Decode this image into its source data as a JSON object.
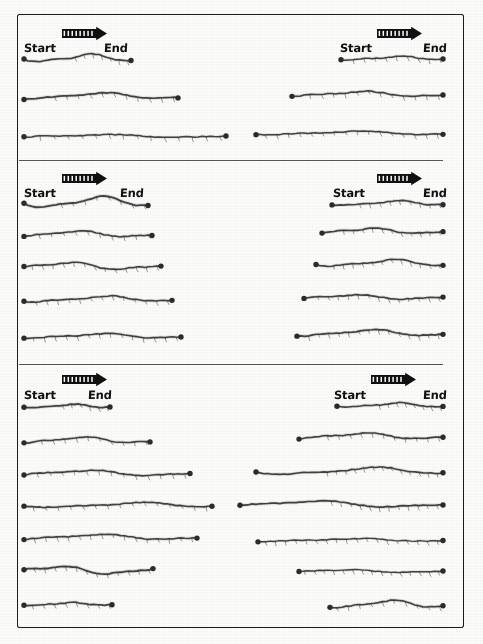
{
  "figure": {
    "kind": "hand-drawn-trajectory-sheet",
    "width": 483,
    "height": 644,
    "background_color": "#fdfdfc",
    "ink_color": "#2b2b2b",
    "frame": {
      "x": 17,
      "y": 14,
      "width": 447,
      "height": 614
    },
    "dividers": [
      {
        "y": 160,
        "x": 19,
        "width": 424
      },
      {
        "y": 364,
        "x": 19,
        "width": 424
      }
    ]
  },
  "labels": {
    "start": "Start",
    "end": "End",
    "arrow_icon": "striped-direction-arrow"
  },
  "chart_data": {
    "type": "line",
    "title": "",
    "xlabel": "",
    "ylabel": "",
    "panels": [
      {
        "id": "panel-1",
        "group": 1,
        "column": "left",
        "arrow": {
          "x": 62,
          "y": 28,
          "w": 45,
          "h": 11
        },
        "label_start": {
          "text": "Start",
          "x": 24,
          "y": 41
        },
        "label_end": {
          "text": "End",
          "x": 104,
          "y": 41
        },
        "traces": [
          {
            "id": "t1",
            "x0": 24,
            "x1": 131,
            "y": 58,
            "amp": 3.2,
            "phase": 0.3,
            "ticks": 7,
            "tick_start": 0.48,
            "weight": 1.6
          },
          {
            "id": "t2",
            "x0": 24,
            "x1": 178,
            "y": 96,
            "amp": 2.6,
            "phase": 1.1,
            "ticks": 11,
            "tick_start": 0.2,
            "weight": 1.7
          },
          {
            "id": "t3",
            "x0": 24,
            "x1": 226,
            "y": 136,
            "amp": 1.2,
            "phase": 2.0,
            "ticks": 14,
            "tick_start": 0.08,
            "weight": 1.5
          }
        ]
      },
      {
        "id": "panel-2",
        "group": 1,
        "column": "right",
        "arrow": {
          "x": 377,
          "y": 28,
          "w": 45,
          "h": 11
        },
        "label_start": {
          "text": "Start",
          "x": 340,
          "y": 41
        },
        "label_end": {
          "text": "End",
          "x": 423,
          "y": 41
        },
        "traces": [
          {
            "id": "t1",
            "x0": 341,
            "x1": 443,
            "y": 58,
            "amp": 1.6,
            "phase": 0.6,
            "ticks": 9,
            "tick_start": 0.12,
            "weight": 1.5
          },
          {
            "id": "t2",
            "x0": 292,
            "x1": 443,
            "y": 94,
            "amp": 2.2,
            "phase": 1.5,
            "ticks": 12,
            "tick_start": 0.12,
            "weight": 1.6
          },
          {
            "id": "t3",
            "x0": 256,
            "x1": 443,
            "y": 133,
            "amp": 1.5,
            "phase": 0.9,
            "ticks": 16,
            "tick_start": 0.05,
            "weight": 1.5
          }
        ]
      },
      {
        "id": "panel-3",
        "group": 2,
        "column": "left",
        "arrow": {
          "x": 62,
          "y": 173,
          "w": 45,
          "h": 11
        },
        "label_start": {
          "text": "Start",
          "x": 24,
          "y": 186
        },
        "label_end": {
          "text": "End",
          "x": 120,
          "y": 186
        },
        "traces": [
          {
            "id": "t1",
            "x0": 24,
            "x1": 148,
            "y": 202,
            "amp": 4.5,
            "phase": 0.2,
            "ticks": 8,
            "tick_start": 0.3,
            "weight": 1.8
          },
          {
            "id": "t2",
            "x0": 24,
            "x1": 152,
            "y": 234,
            "amp": 2.6,
            "phase": 1.8,
            "ticks": 10,
            "tick_start": 0.12,
            "weight": 1.6
          },
          {
            "id": "t3",
            "x0": 24,
            "x1": 161,
            "y": 266,
            "amp": 3.0,
            "phase": 2.6,
            "ticks": 13,
            "tick_start": 0.06,
            "weight": 1.6
          },
          {
            "id": "t4",
            "x0": 24,
            "x1": 172,
            "y": 299,
            "amp": 2.4,
            "phase": 0.8,
            "ticks": 13,
            "tick_start": 0.08,
            "weight": 1.6
          },
          {
            "id": "t5",
            "x0": 24,
            "x1": 181,
            "y": 336,
            "amp": 2.0,
            "phase": 1.2,
            "ticks": 14,
            "tick_start": 0.06,
            "weight": 1.6
          }
        ]
      },
      {
        "id": "panel-4",
        "group": 2,
        "column": "right",
        "arrow": {
          "x": 377,
          "y": 173,
          "w": 45,
          "h": 11
        },
        "label_start": {
          "text": "Start",
          "x": 333,
          "y": 186
        },
        "label_end": {
          "text": "End",
          "x": 423,
          "y": 186
        },
        "traces": [
          {
            "id": "t1",
            "x0": 332,
            "x1": 443,
            "y": 203,
            "amp": 2.0,
            "phase": 0.5,
            "ticks": 9,
            "tick_start": 0.25,
            "weight": 1.6
          },
          {
            "id": "t2",
            "x0": 322,
            "x1": 443,
            "y": 231,
            "amp": 2.4,
            "phase": 1.9,
            "ticks": 11,
            "tick_start": 0.18,
            "weight": 1.7
          },
          {
            "id": "t3",
            "x0": 316,
            "x1": 443,
            "y": 263,
            "amp": 2.8,
            "phase": 0.4,
            "ticks": 12,
            "tick_start": 0.14,
            "weight": 1.6
          },
          {
            "id": "t4",
            "x0": 304,
            "x1": 443,
            "y": 297,
            "amp": 2.0,
            "phase": 2.3,
            "ticks": 13,
            "tick_start": 0.1,
            "weight": 1.6
          },
          {
            "id": "t5",
            "x0": 297,
            "x1": 443,
            "y": 333,
            "amp": 2.6,
            "phase": 1.1,
            "ticks": 14,
            "tick_start": 0.08,
            "weight": 1.7
          }
        ]
      },
      {
        "id": "panel-5",
        "group": 3,
        "column": "left",
        "arrow": {
          "x": 62,
          "y": 374,
          "w": 45,
          "h": 11
        },
        "label_start": {
          "text": "Start",
          "x": 24,
          "y": 388
        },
        "label_end": {
          "text": "End",
          "x": 88,
          "y": 388
        },
        "traces": [
          {
            "id": "t1",
            "x0": 24,
            "x1": 110,
            "y": 406,
            "amp": 1.5,
            "phase": 0.7,
            "ticks": 6,
            "tick_start": 0.45,
            "weight": 1.8
          },
          {
            "id": "t2",
            "x0": 24,
            "x1": 150,
            "y": 440,
            "amp": 2.6,
            "phase": 1.4,
            "ticks": 10,
            "tick_start": 0.14,
            "weight": 1.6
          },
          {
            "id": "t3",
            "x0": 24,
            "x1": 190,
            "y": 473,
            "amp": 2.4,
            "phase": 2.1,
            "ticks": 13,
            "tick_start": 0.08,
            "weight": 1.6
          },
          {
            "id": "t4",
            "x0": 24,
            "x1": 212,
            "y": 505,
            "amp": 2.0,
            "phase": 0.3,
            "ticks": 15,
            "tick_start": 0.05,
            "weight": 1.6
          },
          {
            "id": "t5",
            "x0": 24,
            "x1": 197,
            "y": 537,
            "amp": 2.2,
            "phase": 1.7,
            "ticks": 15,
            "tick_start": 0.06,
            "weight": 1.6
          },
          {
            "id": "t6",
            "x0": 24,
            "x1": 153,
            "y": 570,
            "amp": 3.5,
            "phase": 2.9,
            "ticks": 12,
            "tick_start": 0.08,
            "weight": 1.8
          },
          {
            "id": "t7",
            "x0": 24,
            "x1": 112,
            "y": 604,
            "amp": 1.2,
            "phase": 0.9,
            "ticks": 8,
            "tick_start": 0.1,
            "weight": 1.6
          }
        ]
      },
      {
        "id": "panel-6",
        "group": 3,
        "column": "right",
        "arrow": {
          "x": 371,
          "y": 374,
          "w": 45,
          "h": 11
        },
        "label_start": {
          "text": "Start",
          "x": 334,
          "y": 388
        },
        "label_end": {
          "text": "End",
          "x": 423,
          "y": 388
        },
        "traces": [
          {
            "id": "t1",
            "x0": 337,
            "x1": 443,
            "y": 405,
            "amp": 1.8,
            "phase": 0.6,
            "ticks": 8,
            "tick_start": 0.4,
            "weight": 1.6
          },
          {
            "id": "t2",
            "x0": 299,
            "x1": 443,
            "y": 436,
            "amp": 2.6,
            "phase": 1.6,
            "ticks": 11,
            "tick_start": 0.2,
            "weight": 1.6
          },
          {
            "id": "t3",
            "x0": 256,
            "x1": 443,
            "y": 471,
            "amp": 3.0,
            "phase": 0.2,
            "ticks": 13,
            "tick_start": 0.38,
            "weight": 1.6
          },
          {
            "id": "t4",
            "x0": 240,
            "x1": 443,
            "y": 504,
            "amp": 2.6,
            "phase": 2.2,
            "ticks": 12,
            "tick_start": 0.45,
            "weight": 1.7
          },
          {
            "id": "t5",
            "x0": 258,
            "x1": 443,
            "y": 540,
            "amp": 1.2,
            "phase": 1.0,
            "ticks": 18,
            "tick_start": 0.04,
            "weight": 1.4
          },
          {
            "id": "t6",
            "x0": 299,
            "x1": 443,
            "y": 571,
            "amp": 1.3,
            "phase": 2.5,
            "ticks": 15,
            "tick_start": 0.04,
            "weight": 1.4
          },
          {
            "id": "t7",
            "x0": 330,
            "x1": 443,
            "y": 604,
            "amp": 3.2,
            "phase": 0.8,
            "ticks": 10,
            "tick_start": 0.06,
            "weight": 1.6
          }
        ]
      }
    ]
  }
}
